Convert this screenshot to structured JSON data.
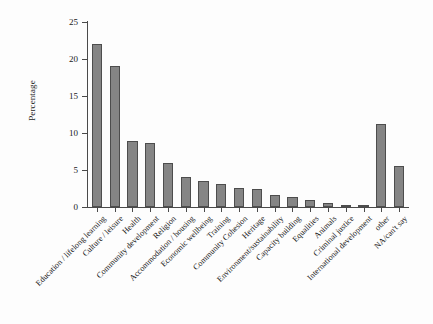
{
  "chart_data": {
    "type": "bar",
    "title": "",
    "xlabel": "",
    "ylabel": "Percentage",
    "ylim": [
      0,
      25
    ],
    "yticks": [
      0,
      5,
      10,
      15,
      20,
      25
    ],
    "grid": false,
    "legend": "none",
    "bar_color": "#858585",
    "bar_edge_color": "#4d4d4d",
    "axis_color": "#4a4a4a",
    "categories": [
      "Education / lifelong learning",
      "Culture / leisure",
      "Health",
      "Community development",
      "Religion",
      "Accommodation / housing",
      "Economic wellbeing",
      "Training",
      "Community Cohesion",
      "Heritage",
      "Environment/sustainability",
      "Capacity building",
      "Equalities",
      "Animals",
      "Criminal justice",
      "International development",
      "other",
      "NA/can't say"
    ],
    "values": [
      22.0,
      19.1,
      8.9,
      8.6,
      6.0,
      4.0,
      3.5,
      3.1,
      2.6,
      2.4,
      1.6,
      1.3,
      1.0,
      0.6,
      0.2,
      0.2,
      11.2,
      5.5
    ]
  }
}
